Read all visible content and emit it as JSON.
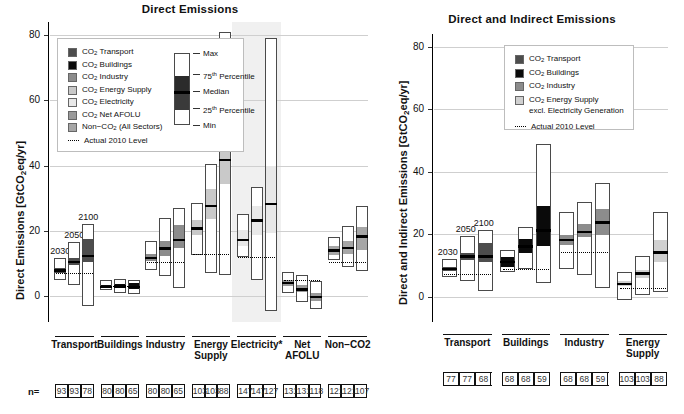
{
  "figure": {
    "panels": [
      {
        "id": "left",
        "title": "Direct Emissions",
        "ylabel_pre": "Direct Emissions [GtCO",
        "ylabel_sub": "2",
        "ylabel_post": "eq/yr]",
        "n_label": "n=",
        "legend": {
          "items": [
            {
              "label_pre": "CO",
              "sub": "2",
              "label_post": " Transport",
              "color": "#4d4d4d"
            },
            {
              "label_pre": "CO",
              "sub": "2",
              "label_post": " Buildings",
              "color": "#0a0a0a"
            },
            {
              "label_pre": "CO",
              "sub": "2",
              "label_post": " Industry",
              "color": "#8c8c8c"
            },
            {
              "label_pre": "CO",
              "sub": "2",
              "label_post": " Energy Supply",
              "color": "#c9c9c9"
            },
            {
              "label_pre": "CO",
              "sub": "2",
              "label_post": " Electricity",
              "color": "#e8e8e8"
            },
            {
              "label_pre": "CO",
              "sub": "2",
              "label_post": " Net AFOLU",
              "color": "#9a9a9a"
            },
            {
              "label_pre": "Non−CO",
              "sub": "2",
              "label_post": " (All Sectors)",
              "color": "#a6a6a6"
            }
          ],
          "refline_label": "Actual 2010 Level",
          "boxplot_keys": [
            "Max",
            "75ᵗʰ Percentile",
            "Median",
            "25ᵗʰ Percentile",
            "Min"
          ],
          "boxplot_keys_plain": [
            "Max",
            "75",
            "Median",
            "25",
            "Min"
          ],
          "boxplot_sup": [
            "",
            "th Percentile",
            "",
            "th Percentile",
            ""
          ]
        },
        "year_labels": [
          "2030",
          "2050",
          "2100"
        ],
        "yaxis": {
          "ticks": [
            0,
            20,
            40,
            60,
            80
          ],
          "min": -8,
          "max": 84
        },
        "categories": [
          {
            "name": "Transport",
            "shaded": false,
            "n": [
              93,
              93,
              78
            ]
          },
          {
            "name": "Buildings",
            "shaded": false,
            "n": [
              80,
              80,
              65
            ]
          },
          {
            "name": "Industry",
            "shaded": false,
            "n": [
              80,
              80,
              65
            ]
          },
          {
            "name": "Energy\nSupply",
            "shaded": false,
            "n": [
              103,
              103,
              88
            ]
          },
          {
            "name": "Electricity*",
            "shaded": true,
            "n": [
              147,
              147,
              127
            ]
          },
          {
            "name": "Net AFOLU",
            "shaded": false,
            "n": [
              131,
              131,
              118
            ]
          },
          {
            "name": "Non−CO2",
            "shaded": false,
            "n": [
              121,
              121,
              107
            ]
          }
        ]
      },
      {
        "id": "right",
        "title": "Direct and Indirect Emissions",
        "ylabel_pre": "Direct and Indirect Emissions [GtCO",
        "ylabel_sub": "2",
        "ylabel_post": "eq/yr]",
        "n_label": "",
        "legend": {
          "items": [
            {
              "label_pre": "CO",
              "sub": "2",
              "label_post": " Transport",
              "color": "#4d4d4d"
            },
            {
              "label_pre": "CO",
              "sub": "2",
              "label_post": " Buildings",
              "color": "#0a0a0a"
            },
            {
              "label_pre": "CO",
              "sub": "2",
              "label_post": " Industry",
              "color": "#8c8c8c"
            },
            {
              "label_pre": "CO",
              "sub": "2",
              "label_post": " Energy Supply",
              "color": "#d0d0d0",
              "line2": "excl. Electricity Generation"
            }
          ],
          "refline_label": "Actual 2010 Level"
        },
        "year_labels": [
          "2030",
          "2050",
          "2100"
        ],
        "yaxis": {
          "ticks": [
            0,
            20,
            40,
            60,
            80
          ],
          "min": -8,
          "max": 84
        },
        "categories": [
          {
            "name": "Transport",
            "n": [
              77,
              77,
              68
            ]
          },
          {
            "name": "Buildings",
            "n": [
              68,
              68,
              59
            ]
          },
          {
            "name": "Industry",
            "n": [
              68,
              68,
              59
            ]
          },
          {
            "name": "Energy\nSupply",
            "n": [
              103,
              103,
              88
            ]
          }
        ]
      }
    ]
  },
  "chart_data": {
    "type": "bar",
    "ylabel": "GtCO2eq/yr",
    "ylim": [
      -8,
      84
    ],
    "grid": true,
    "legend_position": "inside-top-left",
    "panels": [
      {
        "title": "Direct Emissions",
        "actual_2010_levels": {
          "Transport": 7.0,
          "Buildings": 3.2,
          "Industry": 10.5,
          "Energy Supply": 13.0,
          "Electricity*": 12.0,
          "Net AFOLU": 4.9,
          "Non-CO2": 10.5
        },
        "groups": [
          {
            "category": "Transport",
            "color": "#4d4d4d",
            "boxes": [
              {
                "year": "2030",
                "min": 5.0,
                "p25": 7.2,
                "median": 8.0,
                "p75": 8.8,
                "max": 11.5
              },
              {
                "year": "2050",
                "min": 3.2,
                "p25": 9.7,
                "median": 10.7,
                "p75": 11.8,
                "max": 16.5
              },
              {
                "year": "2100",
                "min": -3.0,
                "p25": 10.8,
                "median": 12.5,
                "p75": 17.8,
                "max": 22.0
              }
            ]
          },
          {
            "category": "Buildings",
            "color": "#0a0a0a",
            "boxes": [
              {
                "year": "2030",
                "min": 1.8,
                "p25": 2.6,
                "median": 3.0,
                "p75": 3.6,
                "max": 5.0
              },
              {
                "year": "2050",
                "min": 0.8,
                "p25": 2.6,
                "median": 3.1,
                "p75": 3.8,
                "max": 5.3
              },
              {
                "year": "2100",
                "min": 0.5,
                "p25": 2.3,
                "median": 3.0,
                "p75": 4.2,
                "max": 5.0
              }
            ]
          },
          {
            "category": "Industry",
            "color": "#8c8c8c",
            "boxes": [
              {
                "year": "2030",
                "min": 8.0,
                "p25": 11.0,
                "median": 12.0,
                "p75": 13.2,
                "max": 17.0
              },
              {
                "year": "2050",
                "min": 6.0,
                "p25": 12.5,
                "median": 14.8,
                "p75": 17.2,
                "max": 24.0
              },
              {
                "year": "2100",
                "min": 2.5,
                "p25": 15.0,
                "median": 17.5,
                "p75": 22.0,
                "max": 27.0
              }
            ]
          },
          {
            "category": "Energy Supply",
            "color": "#c9c9c9",
            "boxes": [
              {
                "year": "2030",
                "min": 12.5,
                "p25": 19.0,
                "median": 21.0,
                "p75": 23.5,
                "max": 28.5
              },
              {
                "year": "2050",
                "min": 7.0,
                "p25": 24.0,
                "median": 27.8,
                "p75": 33.0,
                "max": 40.5
              },
              {
                "year": "2100",
                "min": 6.5,
                "p25": 34.5,
                "median": 42.0,
                "p75": 56.0,
                "max": 81.0
              }
            ]
          },
          {
            "category": "Electricity*",
            "color": "#e8e8e8",
            "boxes": [
              {
                "year": "2030",
                "min": 12.0,
                "p25": 15.5,
                "median": 17.5,
                "p75": 20.5,
                "max": 25.0
              },
              {
                "year": "2050",
                "min": 5.0,
                "p25": 19.0,
                "median": 23.5,
                "p75": 28.0,
                "max": 33.5
              },
              {
                "year": "2100",
                "min": -4.5,
                "p25": 19.5,
                "median": 28.5,
                "p75": 40.0,
                "max": 79.0
              }
            ]
          },
          {
            "category": "Net AFOLU",
            "color": "#9a9a9a",
            "boxes": [
              {
                "year": "2030",
                "min": 1.0,
                "p25": 3.5,
                "median": 4.3,
                "p75": 5.2,
                "max": 7.5
              },
              {
                "year": "2050",
                "min": -2.0,
                "p25": 1.5,
                "median": 2.3,
                "p75": 3.5,
                "max": 6.5
              },
              {
                "year": "2100",
                "min": -4.0,
                "p25": -1.2,
                "median": 0.0,
                "p75": 1.3,
                "max": 4.5
              }
            ]
          },
          {
            "category": "Non-CO2",
            "color": "#a6a6a6",
            "boxes": [
              {
                "year": "2030",
                "min": 11.0,
                "p25": 13.0,
                "median": 14.2,
                "p75": 15.5,
                "max": 18.0
              },
              {
                "year": "2050",
                "min": 9.0,
                "p25": 13.0,
                "median": 15.0,
                "p75": 17.0,
                "max": 21.5
              },
              {
                "year": "2100",
                "min": 7.5,
                "p25": 14.5,
                "median": 18.5,
                "p75": 21.5,
                "max": 27.5
              }
            ]
          }
        ]
      },
      {
        "title": "Direct and Indirect Emissions",
        "actual_2010_levels": {
          "Transport": 7.5,
          "Buildings": 8.8,
          "Industry": 14.5,
          "Energy Supply": 3.0
        },
        "groups": [
          {
            "category": "Transport",
            "color": "#4d4d4d",
            "boxes": [
              {
                "year": "2030",
                "min": 6.5,
                "p25": 8.5,
                "median": 9.2,
                "p75": 10.0,
                "max": 12.0
              },
              {
                "year": "2050",
                "min": 5.0,
                "p25": 12.0,
                "median": 13.2,
                "p75": 14.5,
                "max": 19.5
              },
              {
                "year": "2100",
                "min": 2.0,
                "p25": 11.5,
                "median": 13.2,
                "p75": 17.5,
                "max": 21.5
              }
            ]
          },
          {
            "category": "Buildings",
            "color": "#0a0a0a",
            "boxes": [
              {
                "year": "2030",
                "min": 8.0,
                "p25": 10.0,
                "median": 11.5,
                "p75": 13.0,
                "max": 15.0
              },
              {
                "year": "2050",
                "min": 9.0,
                "p25": 14.5,
                "median": 16.5,
                "p75": 19.0,
                "max": 22.5
              },
              {
                "year": "2100",
                "min": 4.5,
                "p25": 16.5,
                "median": 21.5,
                "p75": 29.5,
                "max": 49.0
              }
            ]
          },
          {
            "category": "Industry",
            "color": "#8c8c8c",
            "boxes": [
              {
                "year": "2030",
                "min": 9.0,
                "p25": 17.0,
                "median": 18.5,
                "p75": 20.0,
                "max": 27.0
              },
              {
                "year": "2050",
                "min": 7.0,
                "p25": 19.5,
                "median": 21.0,
                "p75": 23.5,
                "max": 30.5
              },
              {
                "year": "2100",
                "min": 3.0,
                "p25": 20.0,
                "median": 24.0,
                "p75": 28.5,
                "max": 36.5
              }
            ]
          },
          {
            "category": "Energy Supply",
            "color": "#d0d0d0",
            "boxes": [
              {
                "year": "2030",
                "min": -1.0,
                "p25": 3.8,
                "median": 4.5,
                "p75": 5.5,
                "max": 8.0
              },
              {
                "year": "2050",
                "min": 0.5,
                "p25": 6.5,
                "median": 7.8,
                "p75": 9.0,
                "max": 13.0
              },
              {
                "year": "2100",
                "min": 1.5,
                "p25": 11.5,
                "median": 14.5,
                "p75": 18.5,
                "max": 27.0
              }
            ]
          }
        ]
      }
    ]
  }
}
